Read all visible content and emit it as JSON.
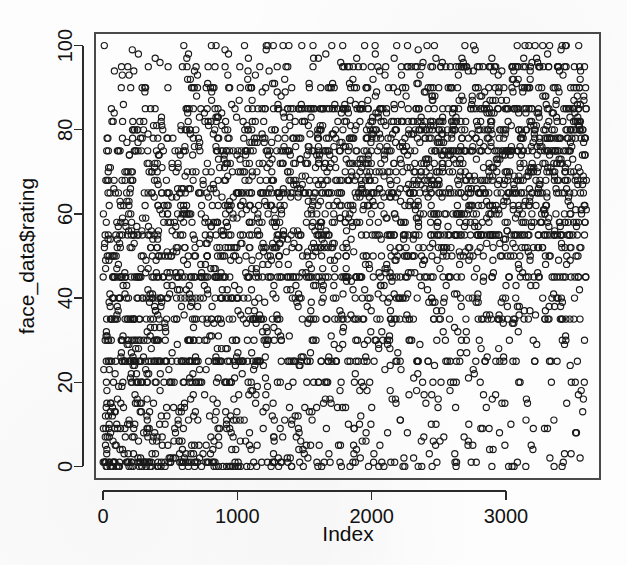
{
  "figure": {
    "background_color": "#fdfdfd",
    "point_color": "#1a1a1a",
    "axis_color": "#2b2b2b",
    "frame_color": "#4a4a4a"
  },
  "chart_data": {
    "type": "scatter",
    "title": "",
    "xlabel": "Index",
    "ylabel": "face_data$rating",
    "xlim": [
      -60,
      3700
    ],
    "ylim": [
      -3,
      103
    ],
    "xticks": [
      0,
      1000,
      2000,
      3000
    ],
    "xtick_labels": [
      "0",
      "1000",
      "2000",
      "3000"
    ],
    "yticks": [
      0,
      20,
      40,
      60,
      80,
      100
    ],
    "ytick_labels": [
      "0",
      "20",
      "40",
      "60",
      "80",
      "100"
    ],
    "grid": false,
    "legend": false,
    "point_marker": "open-circle",
    "point_radius_px": 3.1,
    "n_points": 3600,
    "x_range_data": [
      1,
      3600
    ],
    "y_range_data": [
      0,
      100
    ],
    "density_profile": {
      "note": "Relative point density per (index-decile x rating-band) used to synthesize the cloud",
      "rating_bands": [
        [
          0,
          5
        ],
        [
          5,
          15
        ],
        [
          15,
          25
        ],
        [
          25,
          35
        ],
        [
          35,
          45
        ],
        [
          45,
          55
        ],
        [
          55,
          65
        ],
        [
          65,
          75
        ],
        [
          75,
          85
        ],
        [
          85,
          95
        ],
        [
          95,
          100
        ]
      ],
      "index_deciles": [
        [
          0,
          360
        ],
        [
          360,
          720
        ],
        [
          720,
          1080
        ],
        [
          1080,
          1440
        ],
        [
          1440,
          1800
        ],
        [
          1800,
          2160
        ],
        [
          2160,
          2520
        ],
        [
          2520,
          2880
        ],
        [
          2880,
          3240
        ],
        [
          3240,
          3600
        ]
      ],
      "weights": [
        [
          95,
          80,
          78,
          82,
          80,
          72,
          62,
          55,
          46,
          20,
          6
        ],
        [
          60,
          52,
          58,
          66,
          72,
          70,
          66,
          62,
          56,
          26,
          8
        ],
        [
          44,
          40,
          46,
          56,
          66,
          70,
          72,
          70,
          64,
          30,
          10
        ],
        [
          34,
          30,
          38,
          48,
          60,
          68,
          76,
          78,
          74,
          36,
          12
        ],
        [
          26,
          24,
          30,
          40,
          54,
          66,
          80,
          86,
          84,
          42,
          14
        ],
        [
          22,
          20,
          26,
          36,
          50,
          64,
          82,
          92,
          92,
          48,
          16
        ],
        [
          18,
          17,
          22,
          32,
          46,
          62,
          84,
          98,
          100,
          54,
          18
        ],
        [
          15,
          14,
          19,
          28,
          42,
          60,
          86,
          102,
          108,
          60,
          20
        ],
        [
          13,
          12,
          17,
          25,
          39,
          58,
          88,
          106,
          114,
          66,
          22
        ],
        [
          11,
          11,
          15,
          23,
          37,
          56,
          90,
          110,
          120,
          70,
          24
        ]
      ]
    },
    "hot_rating_rows": [
      0,
      1,
      20,
      25,
      30,
      35,
      40,
      45,
      50,
      52,
      55,
      58,
      60,
      62,
      65,
      68,
      70,
      72,
      75,
      78,
      80,
      82,
      85,
      90,
      95,
      100
    ]
  },
  "geometry": {
    "plot_left": 95,
    "plot_right": 600,
    "plot_top": 33,
    "plot_bottom": 479,
    "x_tick_px": [
      117,
      247,
      372,
      502
    ],
    "y_tick_px": [
      465,
      382,
      299,
      216,
      132,
      49
    ],
    "xlabel_pos": [
      348,
      541
    ],
    "ylabel_pos": [
      34,
      256
    ]
  }
}
